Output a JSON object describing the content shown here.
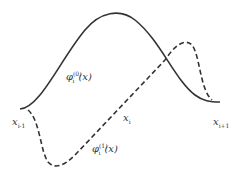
{
  "diagram": {
    "curves": [
      {
        "name": "phi0",
        "style": "solid",
        "color": "#333333"
      },
      {
        "name": "phi1",
        "style": "dashed",
        "color": "#333333"
      }
    ],
    "labels": {
      "phi0_base": "φ",
      "phi0_sup": "(0)",
      "phi0_sub": "i",
      "phi0_arg": "(x)",
      "phi1_base": "φ",
      "phi1_sup": "(1)",
      "phi1_sub": "i",
      "phi1_arg": "(x)",
      "x_left_base": "x",
      "x_left_sub": "i-1",
      "x_mid_base": "x",
      "x_mid_sub": "i",
      "x_right_base": "x",
      "x_right_sub": "i+1"
    }
  }
}
